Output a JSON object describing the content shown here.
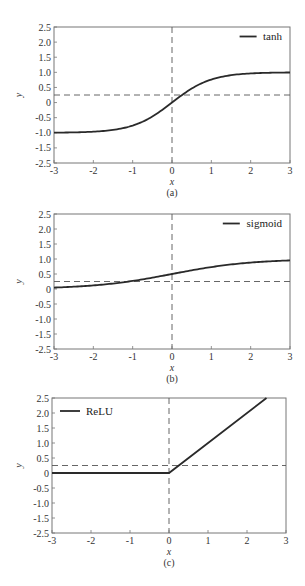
{
  "chart_data": [
    {
      "type": "line",
      "panel_label": "(a)",
      "xlabel": "x",
      "ylabel": "y",
      "xlim": [
        -3,
        3
      ],
      "ylim": [
        -2.5,
        2.5
      ],
      "xticks": [
        "-3",
        "-2",
        "-1",
        "0",
        "1",
        "2",
        "3"
      ],
      "yticks": [
        "2.5",
        "2.0",
        "1.5",
        "1.0",
        "0.5",
        "0",
        "-0.5",
        "-1.0",
        "-1.5",
        "-2.5"
      ],
      "legend": [
        "tanh"
      ],
      "legend_position": "upper right",
      "grid": false,
      "reference_lines": {
        "x": 0,
        "y": 0,
        "style": "dashed"
      },
      "series": [
        {
          "name": "tanh",
          "x": [
            -3,
            -2.5,
            -2,
            -1.5,
            -1,
            -0.5,
            0,
            0.5,
            1,
            1.5,
            2,
            2.5,
            3
          ],
          "values": [
            -0.995,
            -0.987,
            -0.964,
            -0.905,
            -0.762,
            -0.462,
            0,
            0.462,
            0.762,
            0.905,
            0.964,
            0.987,
            0.995
          ]
        }
      ],
      "frame": {
        "left": 54,
        "top": 27,
        "right": 290,
        "bottom": 163
      }
    },
    {
      "type": "line",
      "panel_label": "(b)",
      "xlabel": "x",
      "ylabel": "y",
      "xlim": [
        -3,
        3
      ],
      "ylim": [
        -2.5,
        2.5
      ],
      "xticks": [
        "-3",
        "-2",
        "-1",
        "0",
        "1",
        "2",
        "3"
      ],
      "yticks": [
        "2.5",
        "2.0",
        "1.5",
        "1.0",
        "0.5",
        "0",
        "-0.5",
        "-1.0",
        "-1.5",
        "-2.5"
      ],
      "legend": [
        "sigmoid"
      ],
      "legend_position": "upper right",
      "grid": false,
      "reference_lines": {
        "x": 0,
        "y": 0,
        "style": "dashed"
      },
      "series": [
        {
          "name": "sigmoid",
          "x": [
            -3,
            -2.5,
            -2,
            -1.5,
            -1,
            -0.5,
            0,
            0.5,
            1,
            1.5,
            2,
            2.5,
            3
          ],
          "values": [
            0.047,
            0.076,
            0.119,
            0.182,
            0.269,
            0.378,
            0.5,
            0.622,
            0.731,
            0.818,
            0.881,
            0.924,
            0.953
          ]
        }
      ],
      "frame": {
        "left": 54,
        "top": 214,
        "right": 290,
        "bottom": 349
      }
    },
    {
      "type": "line",
      "panel_label": "(c)",
      "xlabel": "x",
      "ylabel": "y",
      "xlim": [
        -3,
        3
      ],
      "ylim": [
        -2.5,
        2.5
      ],
      "xticks": [
        "-3",
        "-2",
        "-1",
        "0",
        "1",
        "2",
        "3"
      ],
      "yticks": [
        "2.5",
        "2.0",
        "1.5",
        "1.0",
        "0.5",
        "0",
        "-0.5",
        "-1.0",
        "-1.5",
        "-2.5"
      ],
      "legend": [
        "ReLU"
      ],
      "legend_position": "upper left",
      "grid": false,
      "reference_lines": {
        "x": 0,
        "y": 0,
        "style": "dashed"
      },
      "series": [
        {
          "name": "ReLU",
          "x": [
            -3,
            0,
            2.5
          ],
          "values": [
            0,
            0,
            2.5
          ]
        }
      ],
      "frame": {
        "left": 52,
        "top": 398,
        "right": 286,
        "bottom": 533
      }
    }
  ]
}
